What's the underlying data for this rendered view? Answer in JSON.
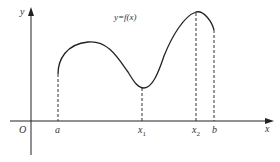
{
  "diagram": {
    "function_label": "y=f(x)",
    "axes": {
      "x_label": "x",
      "y_label": "y",
      "origin_label": "O"
    },
    "points": [
      {
        "id": "a",
        "label": "a",
        "sub": ""
      },
      {
        "id": "x1",
        "label": "x",
        "sub": "1"
      },
      {
        "id": "x2",
        "label": "x",
        "sub": "2"
      },
      {
        "id": "b",
        "label": "b",
        "sub": ""
      }
    ],
    "colors": {
      "curve": "#222222",
      "axis": "#222222",
      "dashed": "#333333",
      "text": "#333333"
    }
  }
}
